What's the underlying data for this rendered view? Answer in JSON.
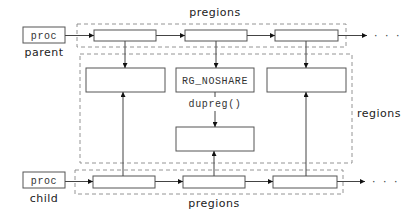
{
  "diagram": {
    "top_group_label": "pregions",
    "bottom_group_label": "pregions",
    "regions_label": "regions",
    "parent": {
      "box_label": "proc",
      "caption": "parent"
    },
    "child": {
      "box_label": "proc",
      "caption": "child"
    },
    "regions": [
      {
        "label": ""
      },
      {
        "label": "RG_NOSHARE"
      },
      {
        "label": ""
      }
    ],
    "copied_region": {
      "label": ""
    },
    "dupreg_label": "dupreg()",
    "continuation": "· · ·"
  }
}
